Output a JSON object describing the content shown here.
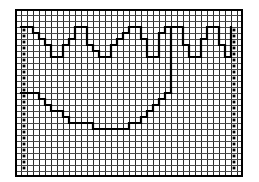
{
  "chart_data": {
    "type": "table",
    "title": "",
    "subtitle": "",
    "xlabel": "",
    "ylabel": "",
    "grid": true,
    "legend": "none",
    "grid_columns": 38,
    "grid_rows": 28,
    "cell_size_px": 6,
    "colors": {
      "background": "#ffffff",
      "cell_fill": "#ffffff",
      "grid_line": "#4a4a4a",
      "major_grid_line": "#2a2a2a",
      "outer_border": "#000000",
      "stitch_line": "#000000",
      "symbol": "#000000"
    },
    "line_weights": {
      "grid_line_px": 1,
      "outer_border_px": 2,
      "stitch_line_px": 2.2
    },
    "symbol_columns": [
      {
        "name": "left-symbol-column",
        "column": 1,
        "row_start": 3,
        "row_end": 26,
        "glyph": "filled-square"
      },
      {
        "name": "right-symbol-column",
        "column": 36,
        "row_start": 3,
        "row_end": 26,
        "glyph": "filled-square"
      }
    ],
    "series": [
      {
        "name": "upper-zigzag-backstitch",
        "style": "stepped",
        "points": [
          [
            1,
            3
          ],
          [
            3,
            3
          ],
          [
            3,
            4
          ],
          [
            4,
            4
          ],
          [
            4,
            5
          ],
          [
            5,
            5
          ],
          [
            5,
            6
          ],
          [
            6,
            6
          ],
          [
            6,
            8
          ],
          [
            8,
            8
          ],
          [
            8,
            6
          ],
          [
            9,
            6
          ],
          [
            9,
            5
          ],
          [
            10,
            5
          ],
          [
            10,
            3
          ],
          [
            12,
            3
          ],
          [
            12,
            6
          ],
          [
            13,
            6
          ],
          [
            13,
            7
          ],
          [
            14,
            7
          ],
          [
            14,
            8
          ],
          [
            16,
            8
          ],
          [
            16,
            6
          ],
          [
            17,
            6
          ],
          [
            17,
            5
          ],
          [
            18,
            5
          ],
          [
            18,
            4
          ],
          [
            19,
            4
          ],
          [
            19,
            3
          ],
          [
            21,
            3
          ],
          [
            21,
            5
          ],
          [
            22,
            5
          ],
          [
            22,
            8
          ],
          [
            24,
            8
          ],
          [
            24,
            4
          ],
          [
            25,
            4
          ],
          [
            25,
            3
          ],
          [
            26,
            3
          ],
          [
            26,
            14
          ]
        ]
      },
      {
        "name": "upper-zigzag-backstitch-right",
        "style": "stepped",
        "points": [
          [
            26,
            3
          ],
          [
            28,
            3
          ],
          [
            28,
            6
          ],
          [
            29,
            6
          ],
          [
            29,
            8
          ],
          [
            31,
            8
          ],
          [
            31,
            5
          ],
          [
            32,
            5
          ],
          [
            32,
            3
          ],
          [
            34,
            3
          ],
          [
            34,
            6
          ],
          [
            35,
            6
          ],
          [
            35,
            8
          ],
          [
            36,
            8
          ],
          [
            36,
            5
          ],
          [
            36,
            3
          ]
        ]
      },
      {
        "name": "lower-valley-backstitch",
        "style": "stepped",
        "points": [
          [
            1,
            14
          ],
          [
            4,
            14
          ],
          [
            4,
            15
          ],
          [
            5,
            15
          ],
          [
            5,
            16
          ],
          [
            6,
            16
          ],
          [
            6,
            17
          ],
          [
            8,
            17
          ],
          [
            8,
            18
          ],
          [
            9,
            18
          ],
          [
            9,
            19
          ],
          [
            13,
            19
          ],
          [
            13,
            20
          ],
          [
            19,
            20
          ],
          [
            19,
            19
          ],
          [
            21,
            19
          ],
          [
            21,
            18
          ],
          [
            22,
            18
          ],
          [
            22,
            17
          ],
          [
            23,
            17
          ],
          [
            23,
            16
          ],
          [
            24,
            16
          ],
          [
            24,
            15
          ],
          [
            25,
            15
          ],
          [
            25,
            14
          ],
          [
            26,
            14
          ]
        ]
      }
    ]
  },
  "chart": {
    "name": "cross-stitch-chart",
    "caption": ""
  }
}
